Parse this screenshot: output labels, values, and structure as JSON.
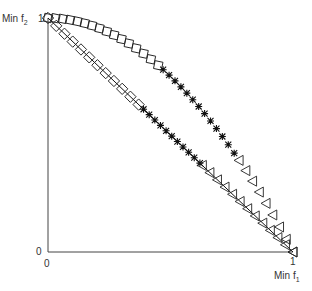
{
  "chart_data": {
    "type": "scatter",
    "title": "",
    "xlabel": "Min f1",
    "ylabel": "Min f2",
    "xlim": [
      0,
      1
    ],
    "ylim": [
      0,
      1
    ],
    "x_ticks": [
      "0",
      "1"
    ],
    "y_ticks": [
      "0",
      "1"
    ],
    "grid": false,
    "legend": "none",
    "fronts": [
      {
        "name": "linear-front",
        "equation": "f2 = 1 - f1",
        "line": true,
        "segments": [
          {
            "marker": "diamond",
            "f1_range": [
              0.0,
              0.37
            ],
            "count": 12
          },
          {
            "marker": "asterisk",
            "f1_range": [
              0.39,
              0.62
            ],
            "count": 11
          },
          {
            "marker": "triangle-left",
            "f1_range": [
              0.63,
              1.0
            ],
            "count": 13
          }
        ]
      },
      {
        "name": "concave-front",
        "equation": "f2 = 1 - f1^2",
        "line": false,
        "segments": [
          {
            "marker": "square",
            "f1_range": [
              0.0,
              0.45
            ],
            "count": 16
          },
          {
            "marker": "asterisk",
            "f1_range": [
              0.47,
              0.76
            ],
            "count": 13
          },
          {
            "marker": "triangle-left",
            "f1_range": [
              0.78,
              1.0
            ],
            "count": 9
          }
        ]
      }
    ]
  },
  "labels": {
    "y_axis_label": "Min f",
    "y_axis_sub": "2",
    "x_axis_label": "Min f",
    "x_axis_sub": "1",
    "y_top_tick": "1",
    "y_zero_tick": "0",
    "x_zero_tick": "0",
    "x_one_tick": "1"
  }
}
